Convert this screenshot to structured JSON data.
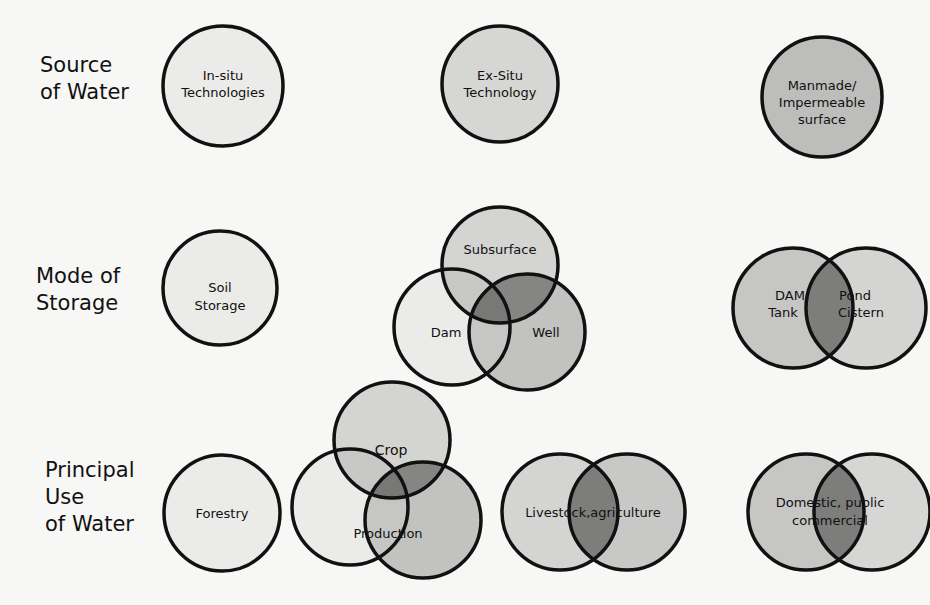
{
  "colors": {
    "light": "#e8e8e6",
    "mid": "#cfcfcd",
    "dark": "#bcbcba",
    "overlap": "#8e8e8c",
    "deep": "#6f6f6d",
    "stroke": "#111111"
  },
  "rows": [
    {
      "label": "Source\nof Water"
    },
    {
      "label": "Mode of\nStorage"
    },
    {
      "label": "Principal\nUse\nof Water"
    }
  ],
  "source": {
    "insitu": {
      "l1": "In-situ",
      "l2": "Technologies"
    },
    "exsitu": {
      "l1": "Ex-Situ",
      "l2": "Technology"
    },
    "manmade": {
      "l1": "Manmade/",
      "l2": "Impermeable",
      "l3": "surface"
    }
  },
  "storage": {
    "soil": {
      "l1": "Soil",
      "l2": "Storage"
    },
    "venn3": {
      "top": "Subsurface",
      "left": "Dam",
      "right": "Well"
    },
    "venn2": {
      "left1": "DAM,",
      "left2": "Tank",
      "right1": "Pond",
      "right2": "Cistern"
    }
  },
  "use": {
    "forestry": "Forestry",
    "venn3": {
      "top": "Crop",
      "bottom": "Production"
    },
    "livestock": "Livestock,agriculture",
    "domestic": {
      "l1": "Domestic, public",
      "l2": "commercial"
    }
  }
}
